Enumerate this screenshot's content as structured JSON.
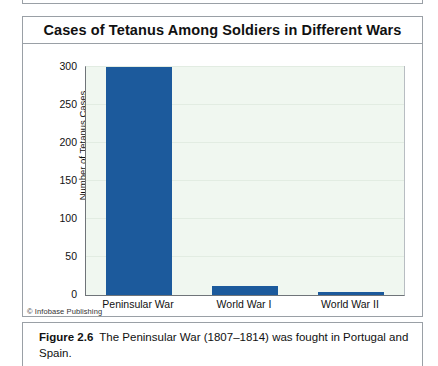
{
  "figure": {
    "title": "Cases of Tetanus Among Soldiers in Different Wars",
    "credit": "© Infobase Publishing",
    "caption_number": "Figure 2.6",
    "caption_text": "The Peninsular War (1807–1814) was fought in Portugal and Spain."
  },
  "colors": {
    "bar": "#1c5a9c",
    "plot_background": "#f0f7f0",
    "gridline": "#e2ece2",
    "frame_border": "#9aa0a6",
    "axis_line": "#6f7479"
  },
  "chart_data": {
    "type": "bar",
    "title": "Cases of Tetanus Among Soldiers in Different Wars",
    "xlabel": "",
    "ylabel": "Number of Tetanus Cases",
    "categories": [
      "Peninsular War",
      "World War I",
      "World War II"
    ],
    "values": [
      300,
      12,
      4
    ],
    "ylim": [
      0,
      300
    ],
    "yticks": [
      0,
      50,
      100,
      150,
      200,
      250,
      300
    ],
    "ytick_labels": [
      "0",
      "50",
      "100",
      "150",
      "200",
      "250",
      "300"
    ],
    "grid": true,
    "legend": false,
    "series": [
      {
        "name": "Tetanus cases",
        "values": [
          300,
          12,
          4
        ]
      }
    ]
  }
}
